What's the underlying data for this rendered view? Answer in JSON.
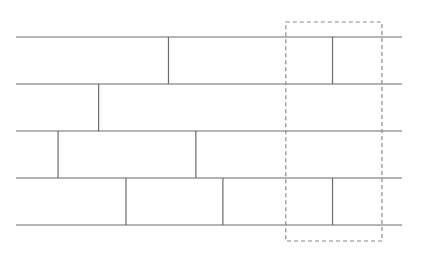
{
  "diagram": {
    "rows": 4,
    "row_joints": [
      [
        0.395,
        0.82
      ],
      [
        0.214
      ],
      [
        0.109,
        0.466
      ],
      [
        0.285,
        0.536,
        0.82
      ]
    ],
    "selection": {
      "style": "dashed",
      "x_range": [
        0.699,
        0.948
      ]
    },
    "colors": {
      "line": "#6b6b6b",
      "dashed": "#8a8a8a",
      "background": "#ffffff"
    }
  }
}
